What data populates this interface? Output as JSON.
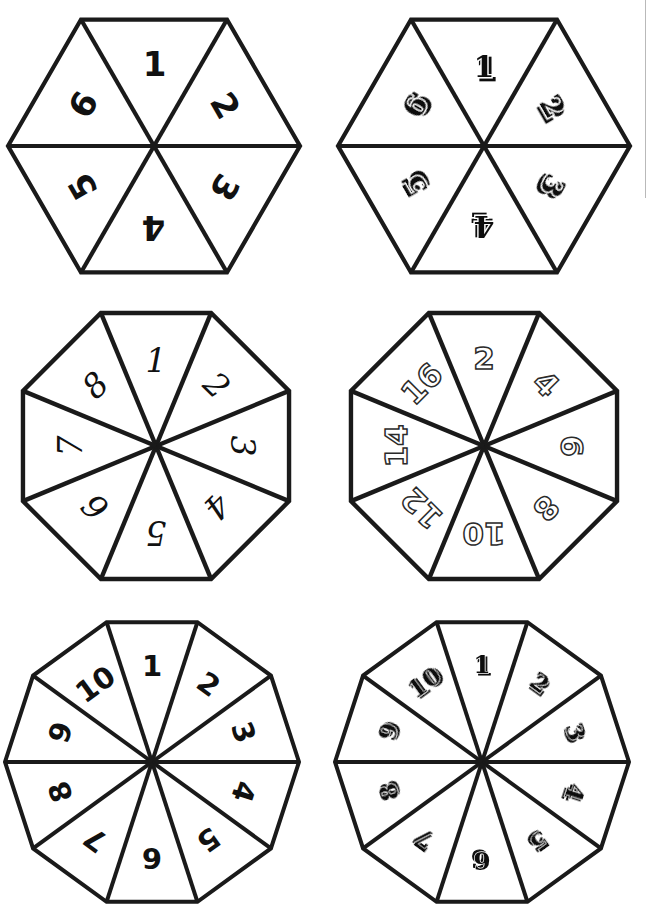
{
  "page": {
    "background_color": "#ffffff",
    "ink_color": "#1a1a1a",
    "width": 652,
    "height": 922
  },
  "artifact": {
    "name": "scan-edge-line",
    "color": "#b9b9b9",
    "x": 645,
    "y": 0,
    "height": 198
  },
  "spinners": [
    {
      "id": "hexagon-1-6-block",
      "shape": "hexagon",
      "sides": 6,
      "sectors": 6,
      "font_style": "heavy-geometric-sans",
      "style_class": "style-blockA",
      "labels": [
        "1",
        "2",
        "3",
        "4",
        "5",
        "6"
      ],
      "left": 2,
      "top": 6,
      "size": 304,
      "cx": 152,
      "cy": 140,
      "radius": 146,
      "start_angle": -30,
      "label_radius": 82,
      "stroke_width": 4.2
    },
    {
      "id": "hexagon-1-6-shadow",
      "shape": "hexagon",
      "sides": 6,
      "sectors": 6,
      "font_style": "bold-3d-shadow",
      "style_class": "style-shadow",
      "labels": [
        "1",
        "2",
        "3",
        "4",
        "5",
        "6"
      ],
      "left": 330,
      "top": 6,
      "size": 304,
      "cx": 154,
      "cy": 140,
      "radius": 146,
      "start_angle": -30,
      "label_radius": 80,
      "stroke_width": 4.2
    },
    {
      "id": "octagon-1-8-curly",
      "shape": "octagon",
      "sides": 8,
      "sectors": 8,
      "font_style": "ornate-curly-serif",
      "style_class": "style-curly",
      "labels": [
        "1",
        "2",
        "3",
        "4",
        "5",
        "6",
        "7",
        "8"
      ],
      "left": 8,
      "top": 298,
      "size": 300,
      "cx": 148,
      "cy": 148,
      "radius": 144,
      "start_angle": -22.5,
      "label_radius": 86,
      "stroke_width": 4.4
    },
    {
      "id": "octagon-even-2-16-outline",
      "shape": "octagon",
      "sides": 8,
      "sectors": 8,
      "font_style": "hollow-outline",
      "style_class": "style-outline",
      "labels": [
        "2",
        "4",
        "6",
        "8",
        "10",
        "12",
        "14",
        "16"
      ],
      "left": 336,
      "top": 298,
      "size": 300,
      "cx": 148,
      "cy": 148,
      "radius": 144,
      "start_angle": -22.5,
      "label_radius": 88,
      "stroke_width": 4.4
    },
    {
      "id": "decagon-1-10-plain",
      "shape": "decagon",
      "sides": 10,
      "sectors": 10,
      "font_style": "plain-bold-sans",
      "style_class": "style-plain",
      "labels": [
        "1",
        "2",
        "3",
        "4",
        "5",
        "6",
        "7",
        "8",
        "9",
        "10"
      ],
      "left": 2,
      "top": 612,
      "size": 300,
      "cx": 150,
      "cy": 150,
      "radius": 147,
      "start_angle": -18,
      "label_radius": 96,
      "stroke_width": 4.0
    },
    {
      "id": "decagon-1-10-gothic",
      "shape": "decagon",
      "sides": 10,
      "sectors": 10,
      "font_style": "ornate-blackletter",
      "style_class": "style-gothic",
      "labels": [
        "1",
        "2",
        "3",
        "4",
        "5",
        "6",
        "7",
        "8",
        "9",
        "10"
      ],
      "left": 332,
      "top": 612,
      "size": 300,
      "cx": 150,
      "cy": 150,
      "radius": 147,
      "start_angle": -18,
      "label_radius": 98,
      "stroke_width": 4.0
    }
  ]
}
